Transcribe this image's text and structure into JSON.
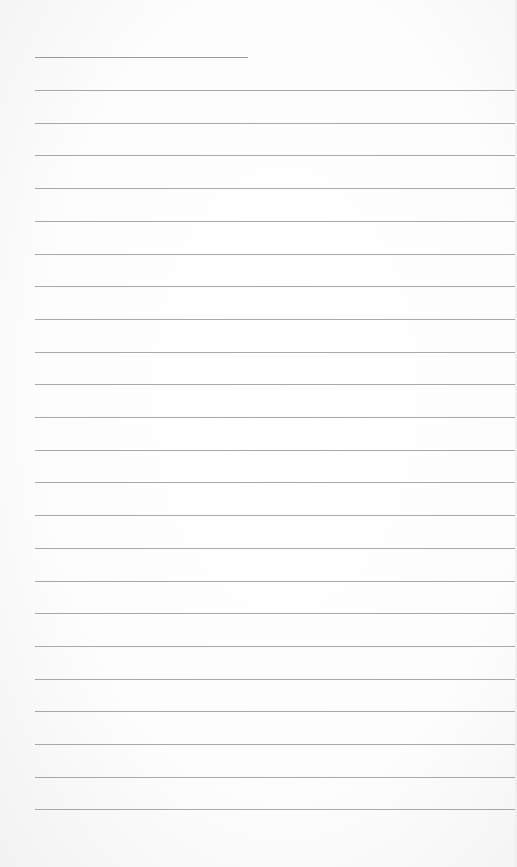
{
  "sheet": {
    "title_line": {
      "x": 35,
      "y": 57,
      "width": 213
    },
    "ruled_lines": {
      "count": 23,
      "start_y": 90,
      "spacing": 32.7,
      "x": 35,
      "width": 481,
      "color": "#a8a8a8"
    },
    "background_color": "#ffffff"
  }
}
